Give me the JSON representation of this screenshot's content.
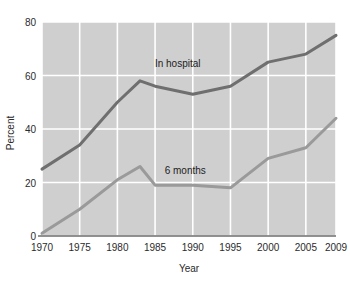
{
  "chart_data": {
    "type": "line",
    "title": "",
    "xlabel": "Year",
    "ylabel": "Percent",
    "xlim": [
      1970,
      2009
    ],
    "ylim": [
      0,
      80
    ],
    "xticks": [
      "1970",
      "1975",
      "1980",
      "1985",
      "1990",
      "1995",
      "2000",
      "2005",
      "2009"
    ],
    "xtick_values": [
      1970,
      1975,
      1980,
      1985,
      1990,
      1995,
      2000,
      2005,
      2009
    ],
    "yticks": [
      "0",
      "20",
      "40",
      "60",
      "80"
    ],
    "ytick_values": [
      0,
      20,
      40,
      60,
      80
    ],
    "grid": true,
    "grid_color": "#ffffff",
    "plot_background": "#cfcfcf",
    "legend": "inline-annotation",
    "series": [
      {
        "name": "In hospital",
        "color": "#6f6f6f",
        "label_x": 1988,
        "label_y": 63,
        "x": [
          1970,
          1975,
          1980,
          1983,
          1985,
          1990,
          1995,
          2000,
          2005,
          2009
        ],
        "values": [
          25,
          34,
          50,
          58,
          56,
          53,
          56,
          65,
          68,
          75
        ]
      },
      {
        "name": "6 months",
        "color": "#9a9a9a",
        "label_x": 1989,
        "label_y": 23,
        "x": [
          1970,
          1975,
          1980,
          1983,
          1985,
          1990,
          1995,
          2000,
          2005,
          2009
        ],
        "values": [
          1,
          10,
          21,
          26,
          19,
          19,
          18,
          29,
          33,
          44
        ]
      }
    ]
  }
}
